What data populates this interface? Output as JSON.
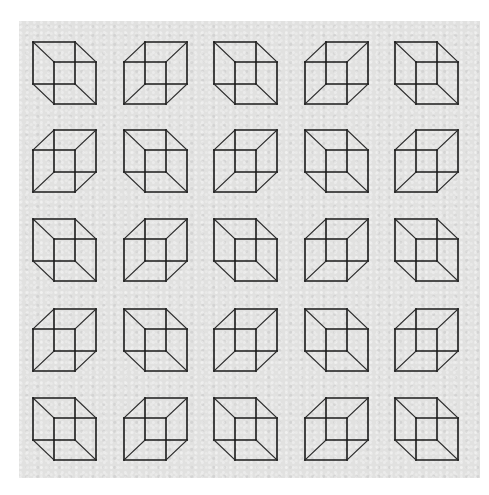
{
  "figure": {
    "background_color": "#e1e1e0",
    "outside_color": "#ffffff",
    "line_color": "#1a1a1a",
    "rows": 5,
    "cols": 5,
    "cube_square_size": 42,
    "cube_depth_offset": {
      "dx": 21,
      "dy": 20
    },
    "col_left_x": [
      33,
      124,
      214,
      305,
      395
    ],
    "row_top_y": [
      42,
      130,
      219,
      309,
      398
    ],
    "orientation_legend": {
      "TL": "back face at upper-left, front face at lower-right",
      "TR": "back face at upper-right, front face at lower-left"
    },
    "grid": [
      [
        "TL",
        "TR",
        "TL",
        "TR",
        "TL"
      ],
      [
        "TR",
        "TL",
        "TR",
        "TL",
        "TR"
      ],
      [
        "TL",
        "TR",
        "TL",
        "TR",
        "TL"
      ],
      [
        "TR",
        "TL",
        "TR",
        "TL",
        "TR"
      ],
      [
        "TL",
        "TR",
        "TL",
        "TR",
        "TL"
      ]
    ]
  }
}
